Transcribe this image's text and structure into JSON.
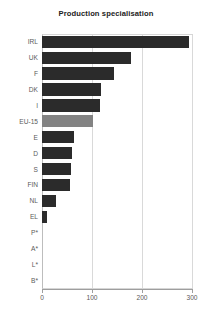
{
  "chart_data": {
    "type": "bar",
    "orientation": "horizontal",
    "title": "Production specialisation",
    "xlabel": "",
    "ylabel": "",
    "categories": [
      "IRL",
      "UK",
      "F",
      "DK",
      "I",
      "EU-15",
      "E",
      "D",
      "S",
      "FIN",
      "NL",
      "EL",
      "P*",
      "A*",
      "L*",
      "B*"
    ],
    "values": [
      294,
      178,
      144,
      118,
      116,
      102,
      64,
      60,
      58,
      56,
      28,
      10,
      0,
      0,
      0,
      0
    ],
    "highlight_category": "EU-15",
    "xlim": [
      0,
      302
    ],
    "xticks": [
      0,
      100,
      200,
      300
    ],
    "xtick_labels": [
      "0",
      "100",
      "200",
      "300"
    ],
    "grid": "vertical",
    "legend": "none",
    "colors": {
      "bar": "#2b2b2b",
      "bar_highlight": "#838383",
      "gridline": "#d9d9d9",
      "axis": "#9e9e9e",
      "tick_text": "#5a5a5a",
      "title_text": "#222222",
      "background": "#ffffff"
    }
  }
}
